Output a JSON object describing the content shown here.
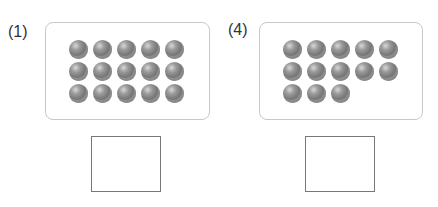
{
  "problems": [
    {
      "label": "(1)",
      "count": 15,
      "rows": [
        5,
        5,
        5
      ],
      "answer": ""
    },
    {
      "label": "(4)",
      "count": 13,
      "rows": [
        5,
        5,
        3
      ],
      "answer": ""
    }
  ],
  "colors": {
    "ball": "#7a7a7a",
    "panel_border": "#c8c8c8",
    "answer_border": "#777777"
  }
}
